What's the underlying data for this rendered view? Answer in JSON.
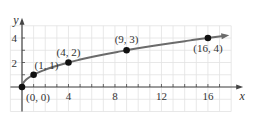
{
  "chart_data": {
    "type": "line",
    "title": "",
    "function": "y = sqrt(x)",
    "xlabel": "x",
    "ylabel": "y",
    "xlim": [
      -1,
      18
    ],
    "ylim": [
      -2,
      5
    ],
    "xticks": [
      4,
      8,
      12,
      16
    ],
    "yticks": [
      2,
      4
    ],
    "grid": true,
    "labeled_points": [
      {
        "x": 0,
        "y": 0,
        "label": "(0, 0)"
      },
      {
        "x": 1,
        "y": 1,
        "label": "(1, 1)"
      },
      {
        "x": 4,
        "y": 2,
        "label": "(4, 2)"
      },
      {
        "x": 9,
        "y": 3,
        "label": "(9, 3)"
      },
      {
        "x": 16,
        "y": 4,
        "label": "(16, 4)"
      }
    ],
    "curve_end_arrow": true,
    "colors": {
      "curve": "#6b6b6b",
      "points": "#111111",
      "grid": "#e2e2e2",
      "axis": "#444444"
    }
  },
  "axes": {
    "x_label": "x",
    "y_label": "y",
    "x_tick_labels": [
      "4",
      "8",
      "12",
      "16"
    ],
    "y_tick_labels": [
      "2",
      "4"
    ]
  }
}
